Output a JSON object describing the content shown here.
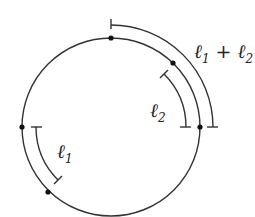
{
  "diagram": {
    "type": "circle-arc-lengths",
    "stroke_color": "#333333",
    "labels": {
      "l1": {
        "base": "ℓ",
        "sub": "1"
      },
      "l2": {
        "base": "ℓ",
        "sub": "2"
      },
      "sum": {
        "a": "ℓ",
        "a_sub": "1",
        "op": " + ",
        "b": "ℓ",
        "b_sub": "2"
      }
    },
    "points": [
      "top",
      "upper-right",
      "right",
      "left",
      "lower-left"
    ]
  }
}
